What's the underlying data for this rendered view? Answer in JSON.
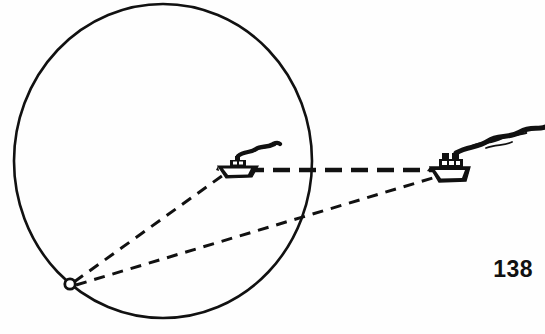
{
  "figure": {
    "page_number": "138",
    "background_color": "#fefefe",
    "ink_color": "#111111",
    "canvas": {
      "width": 545,
      "height": 334
    },
    "circle": {
      "name": "circle-of-position",
      "center_x": 163,
      "center_y": 161,
      "radius_x": 149,
      "radius_y": 157,
      "stroke_width": 2.6,
      "fill": "none"
    },
    "observer": {
      "name": "observer-point",
      "x": 70,
      "y": 284,
      "radius": 5.2,
      "fill": "#ffffff",
      "stroke_width": 2.8
    },
    "ships": [
      {
        "id": "near-ship",
        "label": "small boat",
        "hull_x": 218,
        "hull_y": 170,
        "scale": 1.0,
        "smoke_length": 44
      },
      {
        "id": "far-ship",
        "label": "large ship",
        "hull_x": 428,
        "hull_y": 172,
        "scale": 1.45,
        "smoke_length": 100
      }
    ],
    "lines": [
      {
        "id": "track-line",
        "name": "ship-track-line",
        "style": "heavy-dashed",
        "x1": 247,
        "y1": 170,
        "x2": 447,
        "y2": 170,
        "stroke_width": 4.6,
        "dash": "17 9"
      },
      {
        "id": "sight-line-near",
        "name": "sight-line-to-near-ship",
        "style": "dashed",
        "x1": 74,
        "y1": 282,
        "x2": 226,
        "y2": 173,
        "stroke_width": 3.0,
        "dash": "11 8"
      },
      {
        "id": "sight-line-far",
        "name": "sight-line-to-far-ship",
        "style": "dashed",
        "x1": 76,
        "y1": 285,
        "x2": 446,
        "y2": 174,
        "stroke_width": 3.0,
        "dash": "11 8"
      }
    ]
  }
}
